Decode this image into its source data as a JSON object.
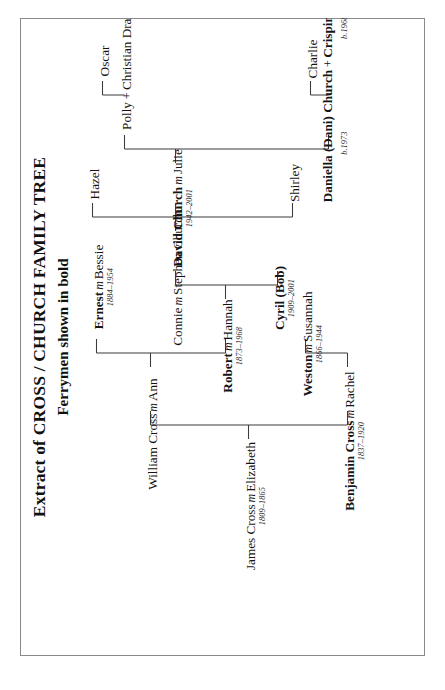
{
  "document": {
    "title": "Extract of CROSS / CHURCH FAMILY TREE",
    "subtitle": "Ferrymen shown in bold",
    "orientation": "rotated-90-ccw",
    "frame_color": "#8a8a8a",
    "ink_color": "#141414"
  },
  "legend": {
    "marriage_symbol": "m",
    "partnership_symbol": "+"
  },
  "tree": {
    "generations": [
      {
        "index": 1,
        "people": [
          {
            "id": "james-cross",
            "name_parts": [
              "James Cross",
              "m",
              "Elizabeth"
            ],
            "display": "James Cross m Elizabeth",
            "dates": "1809–1865",
            "bold": false
          }
        ]
      },
      {
        "index": 2,
        "people": [
          {
            "id": "william-cross",
            "name_parts": [
              "William Cross",
              "m",
              "Ann"
            ],
            "display": "William Cross m Ann",
            "dates": "",
            "bold": false
          },
          {
            "id": "benjamin-cross",
            "name_parts": [
              "Benjamin Cross",
              "m",
              "Rachel"
            ],
            "display": "Benjamin Cross m Rachel",
            "dates": "1837–1920",
            "bold": true
          }
        ]
      },
      {
        "index": 3,
        "people": [
          {
            "id": "robert-cross",
            "name_parts": [
              "Robert",
              "m",
              "Hannah"
            ],
            "display": "Robert m Hannah",
            "dates": "1873–1968",
            "bold": true
          },
          {
            "id": "weston-cross",
            "name_parts": [
              "Weston",
              "m",
              "Susannah"
            ],
            "display": "Weston m Susannah",
            "dates": "1866–1944",
            "bold": true
          }
        ]
      },
      {
        "index": 4,
        "people": [
          {
            "id": "ernest-cross",
            "name_parts": [
              "Ernest",
              "m",
              "Bessie"
            ],
            "display": "Ernest m Bessie",
            "dates": "1884–1954",
            "bold": true
          },
          {
            "id": "connie-church",
            "name_parts": [
              "Connie",
              "m",
              "Stephen Church"
            ],
            "display": "Connie m Stephen Church",
            "dates": "",
            "bold": false
          },
          {
            "id": "cyril-bob",
            "name_parts": [
              "Cyril (Bob)"
            ],
            "display": "Cyril (Bob)",
            "dates": "1909–2001",
            "bold": true
          }
        ]
      },
      {
        "index": 5,
        "people": [
          {
            "id": "hazel",
            "name_parts": [
              "Hazel"
            ],
            "display": "Hazel",
            "dates": "",
            "bold": false
          },
          {
            "id": "david-church",
            "name_parts": [
              "David Church",
              "m",
              "Julie"
            ],
            "display": "David Church m Julie",
            "dates": "1942–2001",
            "bold": true
          },
          {
            "id": "shirley",
            "name_parts": [
              "Shirley"
            ],
            "display": "Shirley",
            "dates": "",
            "bold": false
          }
        ]
      },
      {
        "index": 6,
        "people": [
          {
            "id": "polly-drane",
            "name_parts": [
              "Polly",
              "+",
              "Christian Drane"
            ],
            "display": "Polly + Christian Drane",
            "dates": "",
            "bold": false
          },
          {
            "id": "daniella-chalker",
            "name_parts": [
              "Daniella (Dani) Church",
              "+",
              "Crispin Chalker"
            ],
            "display": "Daniella (Dani) Church + Crispin Chalker",
            "dates_left": "b.1973",
            "dates_right": "b.1968",
            "bold": true
          }
        ]
      },
      {
        "index": 7,
        "people": [
          {
            "id": "oscar",
            "name_parts": [
              "Oscar"
            ],
            "display": "Oscar",
            "dates": "",
            "bold": false
          },
          {
            "id": "charlie",
            "name_parts": [
              "Charlie"
            ],
            "display": "Charlie",
            "dates": "",
            "bold": false
          }
        ]
      }
    ]
  },
  "nodes": {
    "james": {
      "name": "James Cross",
      "m": "m",
      "spouse": "Elizabeth",
      "dates": "1809–1865"
    },
    "william": {
      "name": "William Cross",
      "m": "m",
      "spouse": "Ann",
      "dates": ""
    },
    "benjamin": {
      "name": "Benjamin Cross",
      "m": "m",
      "spouse": "Rachel",
      "dates": "1837–1920"
    },
    "robert": {
      "name": "Robert",
      "m": "m",
      "spouse": "Hannah",
      "dates": "1873–1968"
    },
    "weston": {
      "name": "Weston",
      "m": "m",
      "spouse": "Susannah",
      "dates": "1866–1944"
    },
    "ernest": {
      "name": "Ernest",
      "m": "m",
      "spouse": "Bessie",
      "dates": "1884–1954"
    },
    "connie": {
      "name": "Connie",
      "m": "m",
      "spouse": "Stephen Church",
      "dates": ""
    },
    "cyril": {
      "name": "Cyril (Bob)",
      "m": "",
      "spouse": "",
      "dates": "1909–2001"
    },
    "hazel": {
      "name": "Hazel",
      "m": "",
      "spouse": "",
      "dates": ""
    },
    "david": {
      "name": "David Church",
      "m": "m",
      "spouse": "Julie",
      "dates": "1942–2001"
    },
    "shirley": {
      "name": "Shirley",
      "m": "",
      "spouse": "",
      "dates": ""
    },
    "polly": {
      "name": "Polly",
      "m": "+",
      "spouse": "Christian Drane",
      "dates": ""
    },
    "daniella": {
      "name": "Daniella (Dani) Church",
      "m": "+",
      "spouse": "Crispin Chalker",
      "dates_left": "b.1973",
      "dates_right": "b.1968"
    },
    "oscar": {
      "name": "Oscar",
      "m": "",
      "spouse": "",
      "dates": ""
    },
    "charlie": {
      "name": "Charlie",
      "m": "",
      "spouse": "",
      "dates": ""
    }
  }
}
